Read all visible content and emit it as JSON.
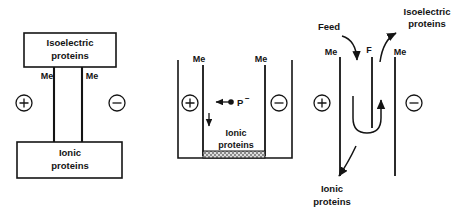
{
  "figure": {
    "background_color": "#ffffff",
    "line_color": "#141414"
  },
  "panels": [
    {
      "id": "panel-left",
      "name": "block-flow-diagram",
      "boxes": [
        {
          "id": "isoelectric-box",
          "line1": "Isoelectric",
          "line2": "proteins"
        },
        {
          "id": "ionic-box",
          "line1": "Ionic",
          "line2": "proteins"
        }
      ],
      "membranes": [
        {
          "id": "membrane-left",
          "label": "Me"
        },
        {
          "id": "membrane-right",
          "label": "Me"
        }
      ],
      "electrodes": [
        {
          "id": "anode",
          "sign": "+",
          "glyph": "⊕"
        },
        {
          "id": "cathode",
          "sign": "−",
          "glyph": "⊖"
        }
      ]
    },
    {
      "id": "panel-middle",
      "name": "batch-cell-diagram",
      "membranes": [
        {
          "id": "membrane-left",
          "label": "Me"
        },
        {
          "id": "membrane-right",
          "label": "Me"
        }
      ],
      "electrodes": [
        {
          "id": "anode",
          "sign": "+",
          "glyph": "⊕"
        },
        {
          "id": "cathode",
          "sign": "−",
          "glyph": "⊖"
        }
      ],
      "species": {
        "id": "protein-anion",
        "label": "P",
        "charge": "−",
        "direction": "left"
      },
      "sediment": {
        "id": "sediment-band",
        "line1": "Ionic",
        "line2": "proteins",
        "settling_arrow": "down"
      }
    },
    {
      "id": "panel-right",
      "name": "continuous-cell-diagram",
      "membranes": [
        {
          "id": "membrane-left",
          "label": "Me"
        },
        {
          "id": "membrane-right",
          "label": "Me"
        }
      ],
      "feed_channel": {
        "id": "feed-channel",
        "label": "F"
      },
      "electrodes": [
        {
          "id": "anode",
          "sign": "+",
          "glyph": "⊕"
        },
        {
          "id": "cathode",
          "sign": "−",
          "glyph": "⊖"
        }
      ],
      "streams": [
        {
          "id": "feed-stream",
          "label": "Feed",
          "direction": "in-down"
        },
        {
          "id": "isoelectric-stream",
          "line1": "Isoelectric",
          "line2": "proteins",
          "direction": "out-up"
        },
        {
          "id": "ionic-stream",
          "line1": "Ionic",
          "line2": "proteins",
          "direction": "out-down"
        }
      ]
    }
  ]
}
